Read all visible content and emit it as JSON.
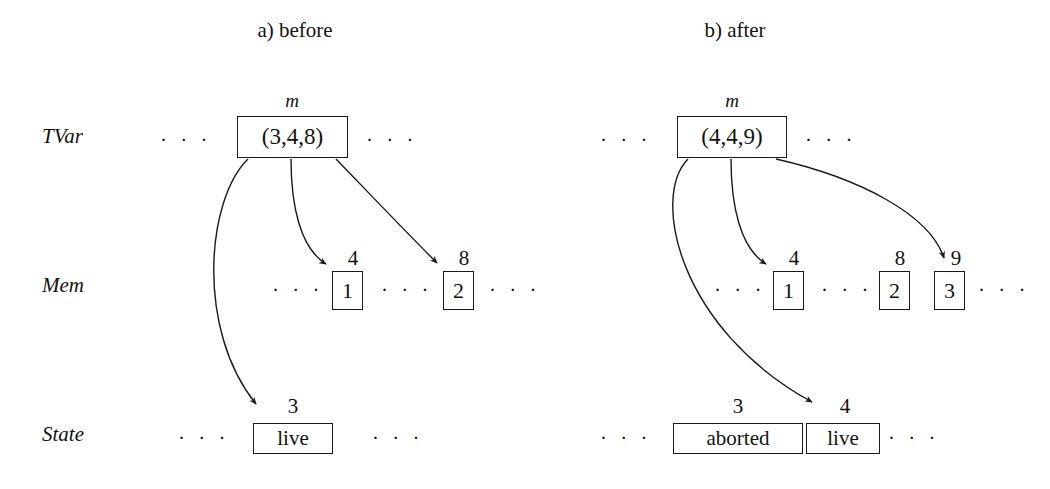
{
  "figure": {
    "panels": [
      {
        "caption": "a)  before",
        "tvar": {
          "marker": "m",
          "value": "(3,4,8)"
        },
        "row_labels": {
          "tvar": "TVar",
          "mem": "Mem",
          "state": "State"
        },
        "mem_cells": [
          {
            "index": "4",
            "value": "1"
          },
          {
            "index": "8",
            "value": "2"
          }
        ],
        "state_cells": [
          {
            "index": "3",
            "value": "live"
          }
        ],
        "ellipsis": "· · ·"
      },
      {
        "caption": "b)  after",
        "tvar": {
          "marker": "m",
          "value": "(4,4,9)"
        },
        "row_labels": {
          "tvar": "TVar",
          "mem": "Mem",
          "state": "State"
        },
        "mem_cells": [
          {
            "index": "4",
            "value": "1"
          },
          {
            "index": "8",
            "value": "2"
          },
          {
            "index": "9",
            "value": "3"
          }
        ],
        "state_cells": [
          {
            "index": "3",
            "value": "aborted"
          },
          {
            "index": "4",
            "value": "live"
          }
        ],
        "ellipsis": "· · ·"
      }
    ],
    "colors": {
      "ink": "#121212",
      "stroke": "#1a1a1a",
      "background": "#ffffff"
    }
  }
}
